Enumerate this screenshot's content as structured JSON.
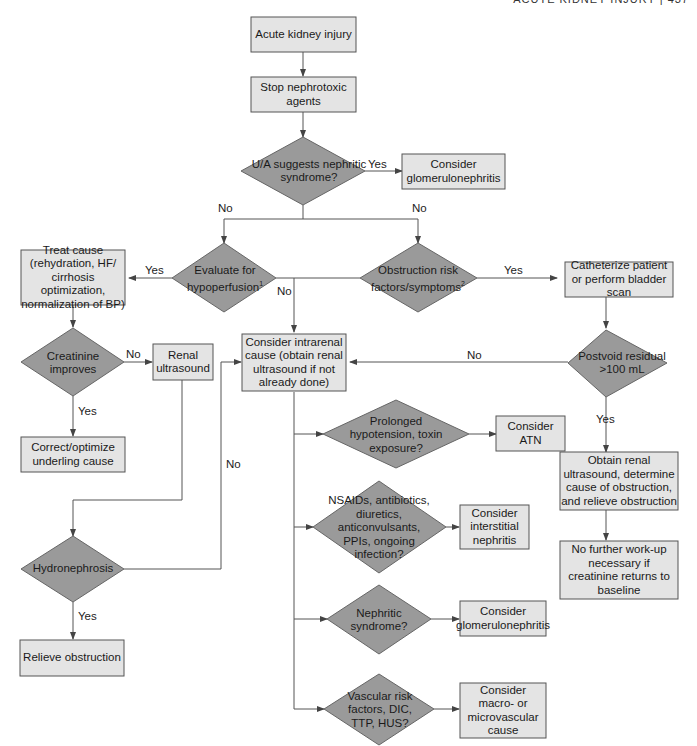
{
  "header": {
    "running_title": "ACUTE KIDNEY INJURY  |  437"
  },
  "nodes": {
    "aki": "Acute kidney injury",
    "stop_nephrotoxic": "Stop nephrotoxic agents",
    "ua_nephritic": "U/A suggests nephritic syndrome?",
    "consider_gn_top": "Consider glomerulonephritis",
    "hypoperfusion": "Evaluate for hypoperfusion",
    "hypoperfusion_sup": "1",
    "obstruction_risk": "Obstruction risk factors/symptoms",
    "obstruction_sup": "2",
    "treat_cause": "Treat cause (rehydration, HF/ cirrhosis optimization, normalization of BP)",
    "catheterize": "Catheterize patient or perform bladder scan",
    "creatinine_improves": "Creatinine improves",
    "renal_us": "Renal ultrasound",
    "intrarenal": "Consider intrarenal cause (obtain renal ultrasound if not already done)",
    "postvoid": "Postvoid residual >100 mL",
    "correct_cause": "Correct/optimize underling cause",
    "prolonged_hypo": "Prolonged hypotension, toxin exposure?",
    "consider_atn": "Consider ATN",
    "nsaids": "NSAIDs, antibiotics, diuretics, anticonvulsants, PPIs, ongoing infection?",
    "consider_ain": "Consider interstitial nephritis",
    "obtain_us": "Obtain renal ultrasound, determine cause of obstruction, and relieve obstruction",
    "no_further": "No further work-up necessary if creatinine returns to baseline",
    "hydronephrosis": "Hydronephrosis",
    "nephritic_syndrome": "Nephritic syndrome?",
    "consider_gn_bottom": "Consider glomerulonephritis",
    "relieve_obstruction": "Relieve obstruction",
    "vascular": "Vascular risk factors, DIC, TTP, HUS?",
    "consider_vascular": "Consider macro- or microvascular cause"
  },
  "edge_labels": {
    "ua_yes": "Yes",
    "ua_no_left": "No",
    "ua_no_right": "No",
    "hypo_yes": "Yes",
    "hypo_no": "No",
    "obst_yes": "Yes",
    "creat_no": "No",
    "creat_yes": "Yes",
    "postvoid_no": "No",
    "postvoid_yes": "Yes",
    "hydro_no": "No",
    "hydro_yes": "Yes"
  },
  "colors": {
    "box_fill": "#e4e4e4",
    "diamond_fill": "#9a9a9a",
    "line": "#555555"
  }
}
